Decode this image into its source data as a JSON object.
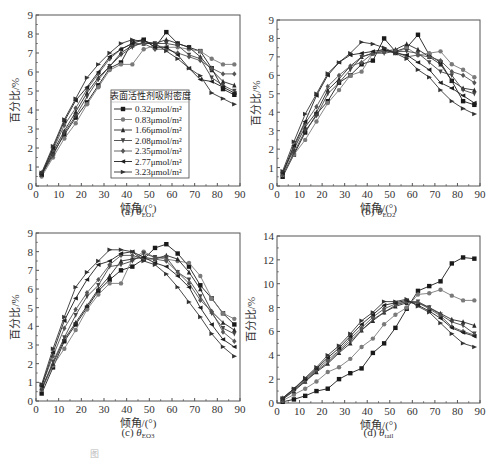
{
  "figure": {
    "bottom_caption": "图"
  },
  "series_names": [
    "0.32μmol/m²",
    "0.83μmol/m²",
    "1.66μmol/m²",
    "2.08μmol/m²",
    "2.35μmol/m²",
    "2.77μmol/m²",
    "3.23μmol/m²"
  ],
  "legend": {
    "title": "表面活性剂吸附密度",
    "markers": [
      "square",
      "circle",
      "triangle-up",
      "triangle-down",
      "diamond",
      "left-triangle",
      "right-triangle"
    ]
  },
  "chart_data": [
    {
      "type": "line",
      "panel": "a",
      "caption_prefix": "(a) ",
      "caption_theta": "θ",
      "caption_sub": "EO1",
      "xlabel": "倾角/(°)",
      "ylabel": "百分比/%",
      "xlim": [
        0,
        90
      ],
      "ylim": [
        0,
        9
      ],
      "xticks": [
        0,
        10,
        20,
        30,
        40,
        50,
        60,
        70,
        80,
        90
      ],
      "yticks": [
        0,
        1,
        2,
        3,
        4,
        5,
        6,
        7,
        8,
        9
      ],
      "grid": false,
      "legend_position": "center-left",
      "x": [
        2.5,
        7.5,
        12.5,
        17.5,
        22.5,
        27.5,
        32.5,
        37.5,
        42.5,
        47.5,
        52.5,
        57.5,
        62.5,
        67.5,
        72.5,
        77.5,
        82.5,
        87.5
      ],
      "series": [
        {
          "name": "0.32μmol/m²",
          "values": [
            0.6,
            1.7,
            2.7,
            3.6,
            4.4,
            5.3,
            6.2,
            6.5,
            7.6,
            7.7,
            7.3,
            8.1,
            7.5,
            7.3,
            7.1,
            6.2,
            5.1,
            4.8
          ]
        },
        {
          "name": "0.83μmol/m²",
          "values": [
            0.5,
            1.5,
            2.5,
            3.3,
            4.3,
            5.2,
            6.1,
            6.4,
            6.4,
            7.2,
            7.4,
            7.3,
            7.3,
            7.2,
            7.1,
            6.7,
            6.4,
            6.4
          ]
        },
        {
          "name": "1.66μmol/m²",
          "values": [
            0.6,
            1.8,
            2.9,
            3.9,
            4.9,
            5.7,
            6.3,
            7.0,
            7.4,
            7.5,
            7.5,
            7.7,
            7.5,
            7.3,
            6.8,
            6.1,
            5.5,
            5.3
          ]
        },
        {
          "name": "2.08μmol/m²",
          "values": [
            0.6,
            1.6,
            2.8,
            3.7,
            4.7,
            5.6,
            6.3,
            6.9,
            7.3,
            7.6,
            7.5,
            7.5,
            7.4,
            6.9,
            6.7,
            5.7,
            5.3,
            5.0
          ]
        },
        {
          "name": "2.35μmol/m²",
          "values": [
            0.7,
            1.9,
            3.2,
            4.1,
            5.1,
            5.9,
            6.7,
            7.2,
            7.5,
            7.5,
            7.2,
            7.2,
            7.0,
            6.8,
            6.6,
            6.2,
            5.9,
            5.9
          ]
        },
        {
          "name": "2.77μmol/m²",
          "values": [
            0.6,
            2.0,
            3.4,
            4.5,
            5.2,
            6.0,
            6.8,
            7.2,
            7.5,
            7.7,
            7.3,
            7.3,
            6.9,
            6.2,
            5.6,
            5.5,
            5.2,
            4.9
          ]
        },
        {
          "name": "3.23μmol/m²",
          "values": [
            0.7,
            2.1,
            3.5,
            4.6,
            5.7,
            6.4,
            7.0,
            7.5,
            7.7,
            7.6,
            7.5,
            7.1,
            6.7,
            6.2,
            5.8,
            4.9,
            4.6,
            4.3
          ]
        }
      ]
    },
    {
      "type": "line",
      "panel": "b",
      "caption_prefix": "(b) ",
      "caption_theta": "θ",
      "caption_sub": "EO2",
      "xlabel": "倾角/(°)",
      "ylabel": "百分比/%",
      "xlim": [
        0,
        90
      ],
      "ylim": [
        0,
        9
      ],
      "xticks": [
        0,
        10,
        20,
        30,
        40,
        50,
        60,
        70,
        80,
        90
      ],
      "yticks": [
        0,
        1,
        2,
        3,
        4,
        5,
        6,
        7,
        8,
        9
      ],
      "grid": false,
      "x": [
        2.5,
        7.5,
        12.5,
        17.5,
        22.5,
        27.5,
        32.5,
        37.5,
        42.5,
        47.5,
        52.5,
        57.5,
        62.5,
        67.5,
        72.5,
        77.5,
        82.5,
        87.5
      ],
      "series": [
        {
          "name": "0.32μmol/m²",
          "values": [
            0.5,
            1.7,
            2.9,
            3.9,
            4.6,
            5.6,
            6.0,
            6.6,
            6.8,
            8.0,
            7.3,
            7.5,
            8.2,
            7.1,
            6.7,
            5.7,
            4.6,
            4.4
          ]
        },
        {
          "name": "0.83μmol/m²",
          "values": [
            0.6,
            1.7,
            2.5,
            3.5,
            4.5,
            5.2,
            6.0,
            6.2,
            7.2,
            7.4,
            7.2,
            7.5,
            7.1,
            7.2,
            7.3,
            6.6,
            6.3,
            5.9
          ]
        },
        {
          "name": "1.66μmol/m²",
          "values": [
            0.7,
            2.0,
            3.2,
            4.0,
            5.2,
            5.8,
            6.5,
            7.0,
            7.2,
            7.3,
            7.4,
            7.7,
            7.4,
            7.0,
            6.6,
            5.7,
            5.3,
            5.2
          ]
        },
        {
          "name": "2.08μmol/m²",
          "values": [
            0.6,
            1.8,
            3.0,
            3.8,
            5.0,
            5.6,
            6.3,
            7.0,
            7.2,
            7.2,
            7.3,
            7.3,
            7.2,
            6.7,
            6.2,
            6.0,
            5.2,
            5.0
          ]
        },
        {
          "name": "2.35μmol/m²",
          "values": [
            0.7,
            2.1,
            3.4,
            4.3,
            5.4,
            6.0,
            6.5,
            6.7,
            7.2,
            7.3,
            7.3,
            7.0,
            7.1,
            7.0,
            6.8,
            6.2,
            6.0,
            5.6
          ]
        },
        {
          "name": "2.77μmol/m²",
          "values": [
            0.7,
            2.2,
            3.5,
            4.9,
            6.0,
            6.7,
            7.1,
            7.2,
            7.3,
            7.4,
            7.2,
            7.1,
            6.7,
            6.3,
            5.6,
            5.3,
            4.9,
            4.5
          ]
        },
        {
          "name": "3.23μmol/m²",
          "values": [
            0.8,
            2.4,
            3.9,
            5.0,
            6.1,
            6.7,
            7.2,
            7.8,
            7.7,
            7.5,
            7.2,
            6.9,
            6.3,
            5.9,
            5.2,
            4.6,
            4.2,
            3.9
          ]
        }
      ]
    },
    {
      "type": "line",
      "panel": "c",
      "caption_prefix": "(c) ",
      "caption_theta": "θ",
      "caption_sub": "EO3",
      "xlabel": "倾角/(°)",
      "ylabel": "百分比/%",
      "xlim": [
        0,
        90
      ],
      "ylim": [
        0,
        9
      ],
      "xticks": [
        0,
        10,
        20,
        30,
        40,
        50,
        60,
        70,
        80,
        90
      ],
      "yticks": [
        0,
        1,
        2,
        3,
        4,
        5,
        6,
        7,
        8,
        9
      ],
      "grid": false,
      "x": [
        2.5,
        7.5,
        12.5,
        17.5,
        22.5,
        27.5,
        32.5,
        37.5,
        42.5,
        47.5,
        52.5,
        57.5,
        62.5,
        67.5,
        72.5,
        77.5,
        82.5,
        87.5
      ],
      "series": [
        {
          "name": "0.32μmol/m²",
          "values": [
            0.4,
            1.8,
            3.2,
            4.1,
            5.0,
            5.9,
            6.5,
            7.0,
            7.2,
            7.6,
            8.2,
            8.4,
            7.9,
            7.2,
            6.2,
            5.5,
            4.7,
            4.1
          ]
        },
        {
          "name": "0.83μmol/m²",
          "values": [
            0.6,
            1.9,
            2.8,
            3.8,
            4.9,
            5.7,
            6.3,
            6.3,
            7.6,
            8.0,
            7.7,
            7.6,
            7.5,
            7.4,
            6.7,
            5.5,
            4.7,
            4.4
          ]
        },
        {
          "name": "1.66μmol/m²",
          "values": [
            0.7,
            2.0,
            3.3,
            4.2,
            5.1,
            6.0,
            6.7,
            7.5,
            7.6,
            7.7,
            7.6,
            7.8,
            7.6,
            6.9,
            6.0,
            4.8,
            4.2,
            3.8
          ]
        },
        {
          "name": "2.08μmol/m²",
          "values": [
            0.6,
            2.1,
            3.4,
            4.6,
            5.6,
            6.2,
            7.2,
            7.3,
            7.5,
            7.9,
            7.7,
            7.7,
            6.9,
            6.5,
            5.6,
            4.7,
            3.9,
            3.6
          ]
        },
        {
          "name": "2.35μmol/m²",
          "values": [
            0.8,
            2.4,
            3.9,
            4.9,
            5.8,
            6.5,
            7.3,
            7.8,
            7.8,
            7.6,
            7.6,
            7.5,
            6.9,
            6.3,
            5.4,
            4.8,
            3.7,
            3.2
          ]
        },
        {
          "name": "2.77μmol/m²",
          "values": [
            0.8,
            2.6,
            4.3,
            5.5,
            6.5,
            7.3,
            7.5,
            7.9,
            8.0,
            7.7,
            7.4,
            7.2,
            6.7,
            6.1,
            5.0,
            4.1,
            3.3,
            2.9
          ]
        },
        {
          "name": "3.23μmol/m²",
          "values": [
            0.9,
            2.8,
            4.5,
            6.1,
            6.9,
            7.5,
            8.1,
            8.1,
            8.0,
            7.5,
            7.3,
            6.8,
            6.1,
            5.3,
            4.5,
            3.6,
            2.9,
            2.4
          ]
        }
      ]
    },
    {
      "type": "line",
      "panel": "d",
      "caption_prefix": "(d) ",
      "caption_theta": "θ",
      "caption_sub": "tail",
      "xlabel": "倾角/(°)",
      "ylabel": "百分比/%",
      "xlim": [
        0,
        90
      ],
      "ylim": [
        0,
        14
      ],
      "xticks": [
        0,
        10,
        20,
        30,
        40,
        50,
        60,
        70,
        80,
        90
      ],
      "yticks": [
        0,
        2,
        4,
        6,
        8,
        10,
        12,
        14
      ],
      "grid": false,
      "x": [
        2.5,
        7.5,
        12.5,
        17.5,
        22.5,
        27.5,
        32.5,
        37.5,
        42.5,
        47.5,
        52.5,
        57.5,
        62.5,
        67.5,
        72.5,
        77.5,
        82.5,
        87.5
      ],
      "series": [
        {
          "name": "0.32μmol/m²",
          "values": [
            0.1,
            0.3,
            0.6,
            1.0,
            1.2,
            2.0,
            2.5,
            2.9,
            4.2,
            5.0,
            6.3,
            7.9,
            9.4,
            9.8,
            10.2,
            11.7,
            12.2,
            12.1
          ]
        },
        {
          "name": "0.83μmol/m²",
          "values": [
            0.2,
            0.7,
            1.2,
            1.8,
            2.6,
            3.0,
            3.7,
            4.7,
            5.4,
            6.6,
            7.4,
            8.0,
            9.1,
            9.2,
            9.5,
            9.0,
            8.6,
            8.6
          ]
        },
        {
          "name": "1.66μmol/m²",
          "values": [
            0.3,
            1.0,
            1.8,
            2.6,
            3.3,
            4.2,
            5.0,
            6.1,
            6.9,
            7.6,
            8.1,
            8.4,
            8.4,
            8.0,
            7.5,
            7.0,
            6.8,
            6.5
          ]
        },
        {
          "name": "2.08μmol/m²",
          "values": [
            0.3,
            1.1,
            1.8,
            2.7,
            3.4,
            4.3,
            5.2,
            6.1,
            7.0,
            7.6,
            8.2,
            8.5,
            8.5,
            8.0,
            7.4,
            6.8,
            6.5,
            5.8
          ]
        },
        {
          "name": "2.35μmol/m²",
          "values": [
            0.4,
            1.1,
            1.9,
            2.8,
            3.6,
            4.4,
            5.4,
            6.3,
            7.2,
            7.9,
            8.3,
            8.5,
            8.4,
            7.9,
            7.3,
            6.4,
            6.0,
            5.7
          ]
        },
        {
          "name": "2.77μmol/m²",
          "values": [
            0.4,
            1.2,
            2.0,
            2.9,
            3.8,
            4.6,
            5.6,
            6.6,
            7.4,
            8.2,
            8.4,
            8.6,
            8.2,
            7.7,
            7.1,
            6.3,
            5.9,
            5.6
          ]
        },
        {
          "name": "3.23μmol/m²",
          "values": [
            0.4,
            1.2,
            2.1,
            3.0,
            4.0,
            4.8,
            5.8,
            6.9,
            7.6,
            8.5,
            8.5,
            8.7,
            8.1,
            7.6,
            6.7,
            5.8,
            5.0,
            4.7
          ]
        }
      ]
    }
  ],
  "style": {
    "series_colors": [
      "#1a1a1a",
      "#7a7a7a",
      "#2a2a2a",
      "#444444",
      "#555555",
      "#1f1f1f",
      "#333333"
    ],
    "axis_color": "#555555"
  }
}
